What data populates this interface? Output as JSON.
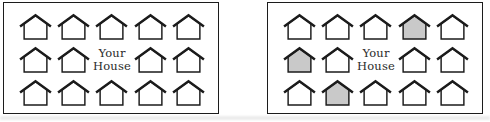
{
  "background": "#ffffff",
  "colors": {
    "panel_border": "#1c1c1c",
    "house_outline": "#1b1b1b",
    "house_fill": "#ffffff",
    "house_fill_shaded": "#c9c9c9",
    "label_color": "#2a2a2a"
  },
  "panels": [
    {
      "id": "neighborhood-panel-left",
      "label": {
        "line1": "Your",
        "line2": "House"
      },
      "grid": {
        "rows": 3,
        "cols": 5
      },
      "cells": [
        "plain",
        "plain",
        "plain",
        "plain",
        "plain",
        "plain",
        "plain",
        "label",
        "plain",
        "plain",
        "plain",
        "plain",
        "plain",
        "plain",
        "plain"
      ]
    },
    {
      "id": "neighborhood-panel-right",
      "label": {
        "line1": "Your",
        "line2": "House"
      },
      "grid": {
        "rows": 3,
        "cols": 5
      },
      "cells": [
        "plain",
        "plain",
        "plain",
        "shaded",
        "plain",
        "shaded",
        "plain",
        "label",
        "plain",
        "plain",
        "plain",
        "shaded",
        "plain",
        "plain",
        "plain"
      ]
    }
  ]
}
